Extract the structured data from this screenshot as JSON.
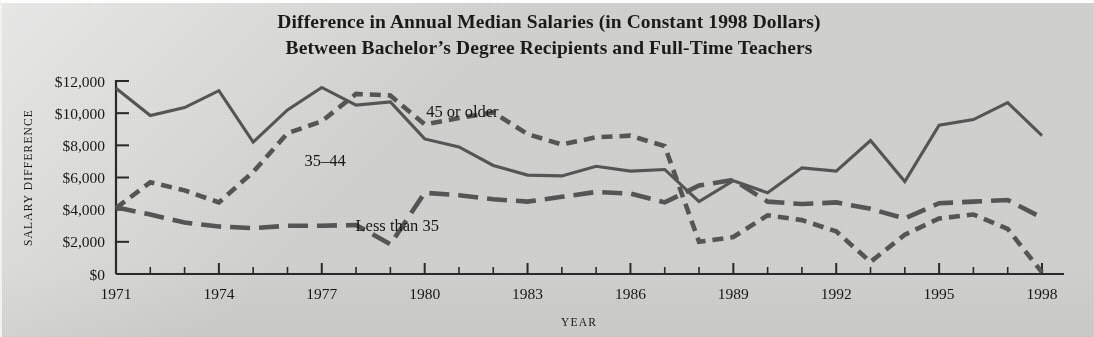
{
  "figure": {
    "title_line_1": "Difference in Annual Median Salaries (in Constant 1998 Dollars)",
    "title_line_2": "Between Bachelor’s Degree Recipients and Full-Time Teachers",
    "background_color": "#d3d3d2",
    "ink_color": "#555555"
  },
  "chart_data": {
    "type": "line",
    "title": "Difference in Annual Median Salaries (in Constant 1998 Dollars) Between Bachelor’s Degree Recipients and Full-Time Teachers",
    "xlabel": "YEAR",
    "ylabel": "SALARY DIFFERENCE",
    "grid": false,
    "legend_position": "inline-annotations",
    "xlim": [
      1971,
      1998
    ],
    "ylim": [
      0,
      12000
    ],
    "x": [
      1971,
      1972,
      1973,
      1974,
      1975,
      1976,
      1977,
      1978,
      1979,
      1980,
      1981,
      1982,
      1983,
      1984,
      1985,
      1986,
      1987,
      1988,
      1989,
      1990,
      1991,
      1992,
      1993,
      1994,
      1995,
      1996,
      1997,
      1998
    ],
    "x_tick_labels": [
      "1971",
      "1974",
      "1977",
      "1980",
      "1983",
      "1986",
      "1989",
      "1992",
      "1995",
      "1998"
    ],
    "x_tick_values": [
      1971,
      1974,
      1977,
      1980,
      1983,
      1986,
      1989,
      1992,
      1995,
      1998
    ],
    "y_tick_labels": [
      "$0",
      "$2,000",
      "$4,000",
      "$6,000",
      "$8,000",
      "$10,000",
      "$12,000"
    ],
    "y_tick_values": [
      0,
      2000,
      4000,
      6000,
      8000,
      10000,
      12000
    ],
    "series": [
      {
        "name": "45 or older",
        "style": "short-dashed",
        "color": "#555555",
        "label_x": 1981.1,
        "label_y": 9750,
        "values": [
          4100,
          5700,
          5200,
          4450,
          6350,
          8750,
          9500,
          11200,
          11100,
          9300,
          9700,
          10050,
          8700,
          8050,
          8500,
          8600,
          7950,
          2000,
          2300,
          3650,
          3350,
          2650,
          750,
          2450,
          3450,
          3700,
          2800,
          100
        ]
      },
      {
        "name": "35–44",
        "style": "solid",
        "color": "#555555",
        "label_x": 1977.1,
        "label_y": 6700,
        "values": [
          11550,
          9850,
          10350,
          11400,
          8200,
          10200,
          11600,
          10500,
          10700,
          8400,
          7900,
          6750,
          6150,
          6100,
          6700,
          6400,
          6500,
          4500,
          5800,
          5050,
          6600,
          6400,
          8300,
          5750,
          9250,
          9600,
          10650,
          8600
        ]
      },
      {
        "name": "Less than 35",
        "style": "long-dashed",
        "color": "#555555",
        "label_x": 1979.2,
        "label_y": 2700,
        "values": [
          4150,
          3700,
          3200,
          2950,
          2850,
          3000,
          3000,
          3050,
          1850,
          5050,
          4900,
          4650,
          4500,
          4800,
          5100,
          5000,
          4450,
          5500,
          5850,
          4500,
          4350,
          4450,
          4050,
          3450,
          4400,
          4500,
          4600,
          3500
        ]
      }
    ]
  }
}
